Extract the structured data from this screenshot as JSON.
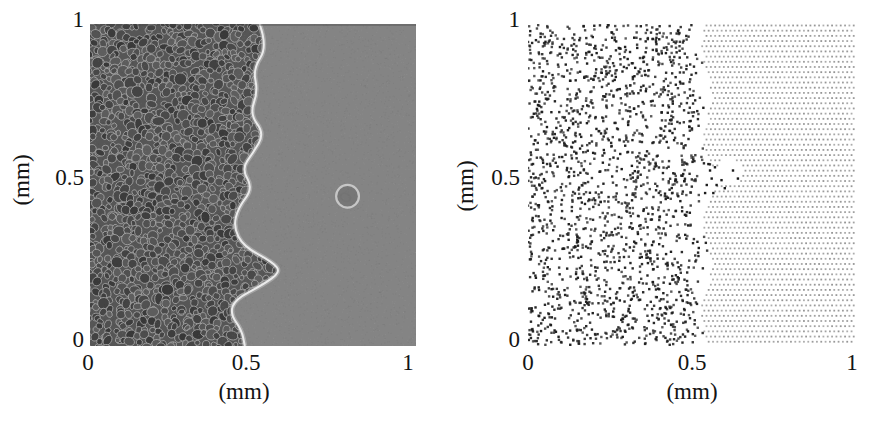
{
  "figure": {
    "background": "#ffffff",
    "panels": {
      "left": {
        "xlabel": "(mm)",
        "ylabel": "(mm)",
        "yticks": {
          "top": "1",
          "mid": "0.5",
          "bottom": "0"
        },
        "xticks": {
          "left": "0",
          "mid": "0.5",
          "right": "1"
        }
      },
      "right": {
        "xlabel": "(mm)",
        "ylabel": "(mm)",
        "yticks": {
          "top": "1",
          "mid": "0.5",
          "bottom": "0"
        },
        "xticks": {
          "left": "0",
          "mid": "0.5",
          "right": "1"
        }
      }
    }
  },
  "chart_data": [
    {
      "type": "heatmap",
      "panel": "left",
      "description": "Phase-contrast micrograph: confluent monolayer of dark polygonal cells with bright borders occupying roughly x < 0.5 mm; irregular advancing front outlined by a bright halo; uniform grey cell-free medium for x > 0.5 mm containing one isolated rounded cell.",
      "xlabel": "(mm)",
      "ylabel": "(mm)",
      "xlim": [
        0,
        1
      ],
      "ylim": [
        0,
        1
      ],
      "xticks": [
        0,
        0.5,
        1
      ],
      "yticks": [
        0,
        0.5,
        1
      ],
      "front_profile_mm": [
        [
          0.52,
          1.0
        ],
        [
          0.545,
          0.93
        ],
        [
          0.5,
          0.86
        ],
        [
          0.515,
          0.79
        ],
        [
          0.49,
          0.72
        ],
        [
          0.535,
          0.66
        ],
        [
          0.5,
          0.6
        ],
        [
          0.465,
          0.55
        ],
        [
          0.5,
          0.49
        ],
        [
          0.455,
          0.43
        ],
        [
          0.44,
          0.37
        ],
        [
          0.47,
          0.31
        ],
        [
          0.56,
          0.26
        ],
        [
          0.585,
          0.23
        ],
        [
          0.53,
          0.19
        ],
        [
          0.445,
          0.145
        ],
        [
          0.43,
          0.1
        ],
        [
          0.465,
          0.05
        ],
        [
          0.475,
          0.0
        ]
      ],
      "isolated_cell_mm": {
        "x": 0.79,
        "y": 0.465,
        "radius_mm": 0.035
      },
      "texture": {
        "cell_diameter_mm": 0.028,
        "seed": 11
      },
      "colors": {
        "medium": "#848484",
        "cell_base": "#565656",
        "cell_fill_min": 56,
        "cell_fill_max": 96,
        "cell_border": "rgba(168,168,168,0.85)",
        "front_halo": "#ebebeb"
      }
    },
    {
      "type": "scatter",
      "panel": "right",
      "xlabel": "(mm)",
      "ylabel": "(mm)",
      "xlim": [
        0,
        1
      ],
      "ylim": [
        0,
        1
      ],
      "xticks": [
        0,
        0.5,
        1
      ],
      "yticks": [
        0,
        0.5,
        1
      ],
      "series": [
        {
          "name": "digitized cell positions",
          "marker": "square-dot",
          "color": "#1c1c1c",
          "marker_size_px": 2.4,
          "n_points": 1750,
          "seed": 23,
          "front_profile_mm": [
            [
              0.5,
              1.0
            ],
            [
              0.47,
              0.94
            ],
            [
              0.505,
              0.88
            ],
            [
              0.485,
              0.8
            ],
            [
              0.515,
              0.72
            ],
            [
              0.5,
              0.64
            ],
            [
              0.525,
              0.57
            ],
            [
              0.5,
              0.5
            ],
            [
              0.485,
              0.44
            ],
            [
              0.505,
              0.37
            ],
            [
              0.52,
              0.3
            ],
            [
              0.5,
              0.23
            ],
            [
              0.485,
              0.16
            ],
            [
              0.505,
              0.09
            ],
            [
              0.51,
              0.0
            ]
          ],
          "n_stragglers": 70,
          "straggler_band_mm": 0.05,
          "outlier_points_mm": [
            [
              0.545,
              0.5
            ],
            [
              0.56,
              0.52
            ],
            [
              0.575,
              0.5
            ],
            [
              0.555,
              0.545
            ],
            [
              0.54,
              0.475
            ],
            [
              0.59,
              0.515
            ],
            [
              0.57,
              0.555
            ],
            [
              0.55,
              0.565
            ],
            [
              0.6,
              0.49
            ],
            [
              0.565,
              0.475
            ],
            [
              0.64,
              0.52
            ],
            [
              0.625,
              0.545
            ]
          ]
        },
        {
          "name": "cell-free lattice",
          "marker": "dot",
          "color": "#9e9e9e",
          "marker_size_px": 1.8,
          "lattice_spacing_mm": {
            "dx": 0.0132,
            "dy": 0.0161
          },
          "row_offset": true,
          "left_edge_profile_mm": [
            [
              0.545,
              1.0
            ],
            [
              0.52,
              0.93
            ],
            [
              0.545,
              0.86
            ],
            [
              0.56,
              0.78
            ],
            [
              0.545,
              0.7
            ],
            [
              0.53,
              0.62
            ],
            [
              0.555,
              0.565
            ],
            [
              0.585,
              0.53
            ],
            [
              0.56,
              0.47
            ],
            [
              0.53,
              0.4
            ],
            [
              0.545,
              0.33
            ],
            [
              0.565,
              0.26
            ],
            [
              0.55,
              0.19
            ],
            [
              0.525,
              0.12
            ],
            [
              0.535,
              0.06
            ],
            [
              0.545,
              0.0
            ]
          ],
          "x_max_mm": 1.0,
          "notch_mm": {
            "x": 0.615,
            "y": 0.54,
            "radius_mm": 0.042
          },
          "seed": 5
        }
      ]
    }
  ]
}
